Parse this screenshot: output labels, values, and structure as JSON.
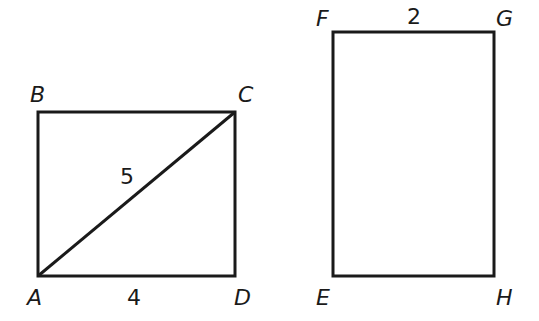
{
  "figure": {
    "stroke_color": "#1a1a1a",
    "background": "#ffffff",
    "rectangle_abcd": {
      "vertices": {
        "A": {
          "label": "A",
          "x": 38,
          "y": 276
        },
        "B": {
          "label": "B",
          "x": 38,
          "y": 112
        },
        "C": {
          "label": "C",
          "x": 235,
          "y": 112
        },
        "D": {
          "label": "D",
          "x": 235,
          "y": 276
        }
      },
      "diagonal": "AC",
      "diagonal_length": "5",
      "side_ad_length": "4"
    },
    "rectangle_efgh": {
      "vertices": {
        "E": {
          "label": "E",
          "x": 333,
          "y": 276
        },
        "F": {
          "label": "F",
          "x": 333,
          "y": 32
        },
        "G": {
          "label": "G",
          "x": 494,
          "y": 32
        },
        "H": {
          "label": "H",
          "x": 494,
          "y": 276
        }
      },
      "side_fg_length": "2"
    }
  }
}
